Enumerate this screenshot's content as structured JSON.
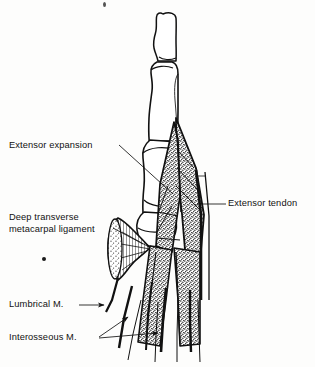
{
  "figure": {
    "view": "dorsolateral view of a finger showing the extensor expansion over the phalanges",
    "background_color": "#fdfdfc",
    "ink_color": "#111111",
    "width": 315,
    "height": 367
  },
  "labels": {
    "extensor_expansion": "Extensor expansion",
    "deep_transverse_line1": "Deep transverse",
    "deep_transverse_line2": "metacarpal ligament",
    "lumbrical": "Lumbrical M.",
    "interosseous": "Interosseous M.",
    "extensor_tendon": "Extensor tendon"
  },
  "anatomy": {
    "structures": [
      "distal phalanx",
      "middle phalanx",
      "proximal phalanx",
      "metacarpal",
      "extensor expansion (dorsal hood)",
      "extensor tendon",
      "deep transverse metacarpal ligament",
      "lumbrical muscle",
      "interosseous muscle"
    ]
  },
  "leaders": {
    "extensor_expansion": "from label right edge down-right to the stippled hood over the proximal phalanx",
    "deep_transverse": "from label right edge down-right to the fan-shaped hatched ligament",
    "lumbrical": "horizontal line to an arrowhead on the lumbrical tendon",
    "interosseous": "two lines fanning up-right to arrowheads on the interosseous tendons",
    "extensor_tendon": "from label left edge down-left to the central tendon band"
  }
}
